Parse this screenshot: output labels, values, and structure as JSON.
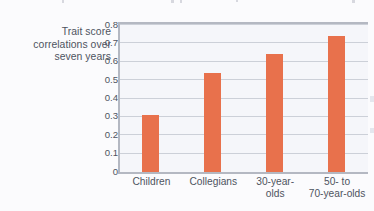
{
  "figure": {
    "axis_title_lines": [
      "Trait score",
      "correlations over",
      "seven years"
    ],
    "bar_color": "#e8714c",
    "gridline_color": "#ccd0d8",
    "axis_color": "#b4b8c2",
    "text_color": "#4e5460",
    "plot_background": "#f5f6fa",
    "page_background": "#fbfbfd"
  },
  "chart_data": {
    "type": "bar",
    "title": "",
    "subtitle": "",
    "xlabel": "",
    "ylabel": "Trait score correlations over seven years",
    "categories": [
      "Children",
      "Collegians",
      "30-year-olds",
      "50- to 70-year-olds"
    ],
    "category_label_lines": [
      [
        "Children"
      ],
      [
        "Collegians"
      ],
      [
        "30-year-",
        "olds"
      ],
      [
        "50- to",
        "70-year-olds"
      ]
    ],
    "values": [
      0.31,
      0.54,
      0.64,
      0.74
    ],
    "ylim": [
      0,
      0.8
    ],
    "ytick_labels": [
      "0.8",
      "0.7",
      "0.6",
      "0.5",
      "0.4",
      "0.3",
      "0.2",
      "0.1",
      "0"
    ],
    "ytick_values": [
      0.8,
      0.7,
      0.6,
      0.5,
      0.4,
      0.3,
      0.2,
      0.1,
      0
    ],
    "grid": true,
    "grid_axis": "y",
    "legend": false,
    "legend_position": "none",
    "series": [
      {
        "name": "Trait score correlations over seven years",
        "values": [
          0.31,
          0.54,
          0.64,
          0.74
        ]
      }
    ]
  }
}
